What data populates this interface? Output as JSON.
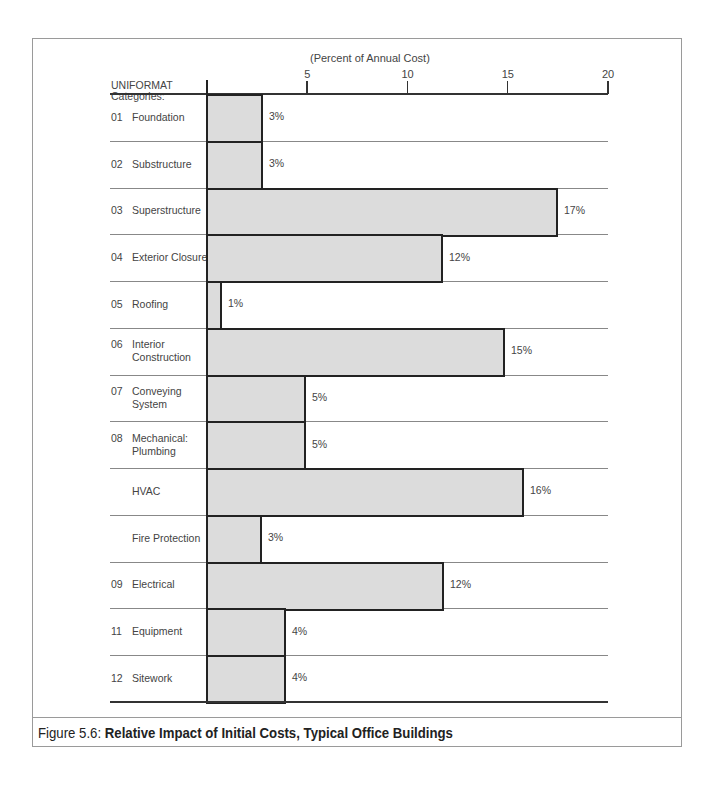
{
  "chart_data": {
    "type": "bar",
    "orientation": "horizontal",
    "title": "Relative Impact of Initial Costs, Typical Office Buildings",
    "figure_label": "Figure 5.6:",
    "xlabel": "(Percent of Annual Cost)",
    "ylabel": "UNIFORMAT Categories:",
    "xlim": [
      0,
      20
    ],
    "xticks": [
      5,
      10,
      15,
      20
    ],
    "grid": false,
    "categories": [
      {
        "code": "01",
        "name": "Foundation"
      },
      {
        "code": "02",
        "name": "Substructure"
      },
      {
        "code": "03",
        "name": "Superstructure"
      },
      {
        "code": "04",
        "name": "Exterior Closure"
      },
      {
        "code": "05",
        "name": "Roofing"
      },
      {
        "code": "06",
        "name": "Interior\nConstruction"
      },
      {
        "code": "07",
        "name": "Conveying\nSystem"
      },
      {
        "code": "08",
        "name": "Mechanical:\nPlumbing"
      },
      {
        "code": "",
        "name": "HVAC"
      },
      {
        "code": "",
        "name": "Fire Protection"
      },
      {
        "code": "09",
        "name": "Electrical"
      },
      {
        "code": "11",
        "name": "Equipment"
      },
      {
        "code": "12",
        "name": "Sitework"
      }
    ],
    "values": [
      3,
      3,
      17,
      12,
      1,
      15,
      5,
      5,
      16,
      3,
      12,
      4,
      4
    ],
    "value_labels": [
      "3%",
      "3%",
      "17%",
      "12%",
      "1%",
      "15%",
      "5%",
      "5%",
      "16%",
      "3%",
      "12%",
      "4%",
      "4%"
    ],
    "bar_px": [
      55,
      55,
      350,
      235,
      14,
      297,
      98,
      98,
      316,
      54,
      236,
      78,
      78
    ],
    "bar_color": "#dcdcdc",
    "bar_edge_color": "#222222"
  },
  "header": {
    "unit_label": "(Percent of Annual Cost)",
    "category_header_line1": "UNIFORMAT",
    "category_header_line2": "Categories:"
  },
  "caption": {
    "prefix": "Figure 5.6: ",
    "title": "Relative Impact of Initial Costs, Typical Office Buildings"
  }
}
